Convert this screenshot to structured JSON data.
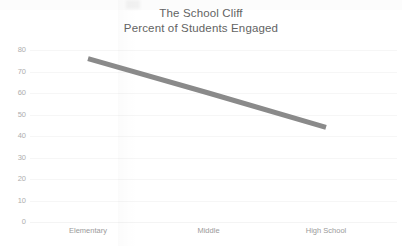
{
  "chart_data": {
    "type": "line",
    "title": "The School Cliff",
    "subtitle": "Percent of Students Engaged",
    "xlabel": "",
    "ylabel": "",
    "categories": [
      "Elementary",
      "Middle",
      "High School"
    ],
    "series": [
      {
        "name": "Percent of Students Engaged",
        "values": [
          76,
          60,
          44
        ],
        "color": "#8a8a8a",
        "line_width": 5
      }
    ],
    "ylim": [
      0,
      80
    ],
    "y_ticks": [
      "80",
      "70",
      "60",
      "50",
      "40",
      "30",
      "20",
      "10",
      "0"
    ],
    "y_tick_values": [
      80,
      70,
      60,
      50,
      40,
      30,
      20,
      10,
      0
    ],
    "grid": true,
    "grid_axis": "y",
    "legend": false,
    "legend_position": "none"
  },
  "titles": {
    "main": "The School Cliff",
    "sub": "Percent of Students Engaged"
  },
  "colors": {
    "line": "#8a8a8a",
    "text": "#636363",
    "tick_text": "#a8a8a8",
    "grid": "#f0f0f0",
    "background": "#ffffff"
  }
}
